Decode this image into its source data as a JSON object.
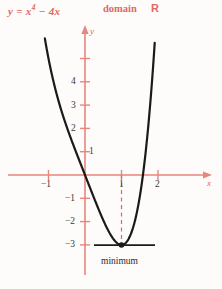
{
  "header": {
    "equation_prefix": "y = x",
    "equation_exponent": "4",
    "equation_suffix": " − 4x",
    "domain_word": "domain",
    "domain_symbol": "R"
  },
  "axes": {
    "x_axis_name": "x",
    "y_axis_name": "y",
    "x_tick_labels": [
      "−1",
      "1",
      "2"
    ],
    "y_tick_labels_positive": [
      "1",
      "2",
      "3",
      "4"
    ],
    "y_tick_labels_negative": [
      "−1",
      "−2",
      "−3"
    ]
  },
  "annotations": {
    "minimum_label": "minimum"
  },
  "colors": {
    "axis_red": "#e8857c",
    "text_red": "#e2685f",
    "curve_black": "#1a1a1a",
    "tick_text": "#3b3a38",
    "background": "#fdfcfa"
  },
  "chart_data": {
    "type": "line",
    "subtitle": "domain ℝ",
    "xlabel": "x",
    "ylabel": "y",
    "xlim": [
      -1.35,
      2.3
    ],
    "ylim": [
      -3.6,
      5.4
    ],
    "grid": false,
    "legend": null,
    "x_ticks": [
      -1,
      1,
      2
    ],
    "y_ticks": [
      -3,
      -2,
      -1,
      1,
      2,
      3,
      4,
      5
    ],
    "y_ticks_labeled": [
      -3,
      -2,
      -1,
      1,
      2,
      3,
      4
    ],
    "series": [
      {
        "name": "y = x^4 - 4x",
        "x": [
          -1.3,
          -1.2,
          -1.1,
          -1.0,
          -0.9,
          -0.8,
          -0.7,
          -0.6,
          -0.5,
          -0.4,
          -0.3,
          -0.2,
          -0.1,
          0.0,
          0.1,
          0.2,
          0.3,
          0.4,
          0.5,
          0.6,
          0.7,
          0.8,
          0.9,
          1.0,
          1.1,
          1.2,
          1.3,
          1.4,
          1.5,
          1.587,
          1.65,
          1.7,
          1.75,
          1.8
        ],
        "y": [
          8.06,
          6.87,
          5.86,
          5.0,
          4.26,
          3.61,
          3.04,
          2.53,
          2.06,
          1.63,
          1.21,
          0.8,
          0.4,
          0.0,
          -0.4,
          -0.8,
          -1.19,
          -1.57,
          -1.94,
          -2.27,
          -2.56,
          -2.79,
          -2.94,
          -3.0,
          -2.94,
          -2.73,
          -2.34,
          -1.76,
          -0.94,
          0.0,
          0.81,
          1.55,
          2.38,
          3.3
        ],
        "color": "#1a1a1a"
      }
    ],
    "points": [
      {
        "name": "minimum",
        "x": 1,
        "y": -3,
        "label": "minimum",
        "marker": "filled-circle"
      }
    ],
    "annotations": [
      {
        "type": "dashed-vline",
        "x": 1,
        "y_from": 0,
        "y_to": -3,
        "color": "#e2685f"
      },
      {
        "type": "tangent-line",
        "at_x": 1,
        "y": -3,
        "x_from": 0.25,
        "x_to": 1.9,
        "color": "#1a1a1a"
      }
    ]
  }
}
